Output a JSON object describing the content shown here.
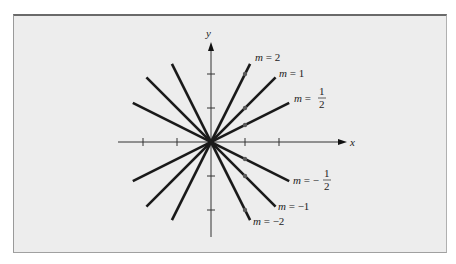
{
  "chart_data": {
    "type": "line",
    "title": "",
    "xlabel": "x",
    "ylabel": "y",
    "origin_px": [
      211,
      142
    ],
    "unit_px": 34,
    "x_ticks": [
      -2,
      -1,
      1,
      2
    ],
    "y_ticks": [
      -2,
      -1,
      1,
      2
    ],
    "xlim": [
      -2.7,
      3.9
    ],
    "ylim": [
      -2.8,
      2.8
    ],
    "grid": false,
    "series": [
      {
        "name": "m = 2",
        "slope": 2,
        "x_range": [
          -1.15,
          1.15
        ],
        "marker_point": [
          1,
          2
        ]
      },
      {
        "name": "m = 1",
        "slope": 1,
        "x_range": [
          -1.9,
          1.9
        ],
        "marker_point": [
          1,
          1
        ]
      },
      {
        "name": "m = 1/2",
        "slope": 0.5,
        "x_range": [
          -2.3,
          2.3
        ],
        "marker_point": [
          1,
          0.5
        ]
      },
      {
        "name": "m = -1/2",
        "slope": -0.5,
        "x_range": [
          -2.3,
          2.3
        ],
        "marker_point": [
          1,
          -0.5
        ]
      },
      {
        "name": "m = -1",
        "slope": -1,
        "x_range": [
          -1.9,
          1.9
        ],
        "marker_point": [
          1,
          -1
        ]
      },
      {
        "name": "m = -2",
        "slope": -2,
        "x_range": [
          -1.15,
          1.15
        ],
        "marker_point": [
          1,
          -2
        ]
      }
    ],
    "labels": [
      {
        "m_text": "m",
        "eq": "=",
        "value": "2",
        "frac": false,
        "x": 255,
        "y": 61
      },
      {
        "m_text": "m",
        "eq": "=",
        "value": "1",
        "frac": false,
        "x": 279,
        "y": 77
      },
      {
        "m_text": "m",
        "eq": "=",
        "num": "1",
        "den": "2",
        "sign": "",
        "frac": true,
        "x": 294,
        "y": 102
      },
      {
        "m_text": "m",
        "eq": "=",
        "num": "1",
        "den": "2",
        "sign": "−",
        "frac": true,
        "x": 293,
        "y": 184
      },
      {
        "m_text": "m",
        "eq": "=",
        "value": "−1",
        "frac": false,
        "x": 278,
        "y": 210
      },
      {
        "m_text": "m",
        "eq": "=",
        "value": "−2",
        "frac": false,
        "x": 253,
        "y": 225
      }
    ]
  },
  "colors": {
    "background": "#ededed",
    "line": "#1a1a1a",
    "marker": "#5a5a5a",
    "axis": "#333333"
  },
  "axis_labels": {
    "x": "x",
    "y": "y"
  }
}
